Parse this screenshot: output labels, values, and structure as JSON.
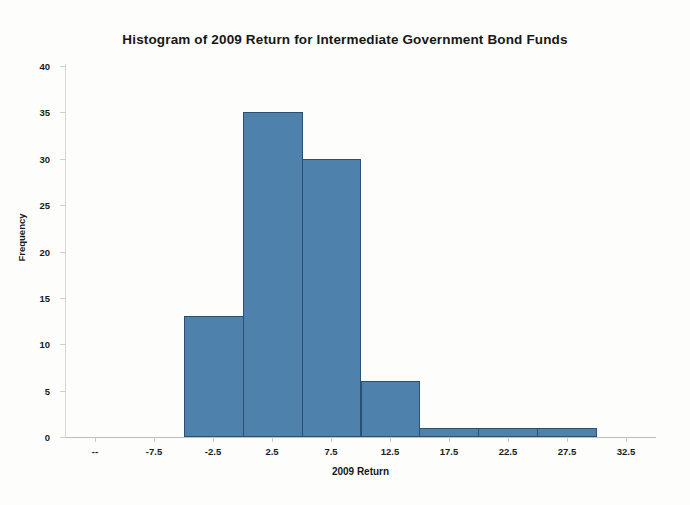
{
  "chart_data": {
    "type": "bar",
    "title": "Histogram of 2009 Return for Intermediate Government Bond Funds",
    "xlabel": "2009 Return",
    "ylabel": "Frequency",
    "categories": [
      "--",
      "-7.5",
      "-2.5",
      "2.5",
      "7.5",
      "12.5",
      "17.5",
      "22.5",
      "27.5",
      "32.5"
    ],
    "bin_centers": [
      -12.5,
      -7.5,
      -2.5,
      2.5,
      7.5,
      12.5,
      17.5,
      22.5,
      27.5,
      32.5
    ],
    "values": [
      0,
      0,
      13,
      35,
      30,
      6,
      1,
      1,
      1,
      0
    ],
    "bars": [
      {
        "label": "-2.5",
        "value": 13
      },
      {
        "label": "2.5",
        "value": 35
      },
      {
        "label": "7.5",
        "value": 30
      },
      {
        "label": "12.5",
        "value": 6
      },
      {
        "label": "17.5",
        "value": 1
      },
      {
        "label": "22.5",
        "value": 1
      },
      {
        "label": "27.5",
        "value": 1
      }
    ],
    "ylim": [
      0,
      40
    ],
    "yticks": [
      "0",
      "5",
      "10",
      "15",
      "20",
      "25",
      "30",
      "35",
      "40"
    ],
    "ytick_values": [
      0,
      5,
      10,
      15,
      20,
      25,
      30,
      35,
      40
    ],
    "grid": false,
    "legend": "none",
    "bar_fill_color": "#4f81ad",
    "bar_border_color": "#2c4f74",
    "axis_color": "#c9c9c9",
    "text_color": "#1b1b1b"
  }
}
